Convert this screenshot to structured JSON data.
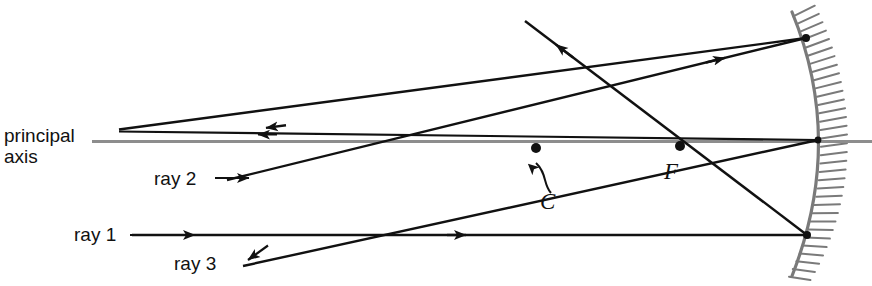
{
  "figure": {
    "labels": {
      "principal_axis": "principal\naxis",
      "ray1": "ray 1",
      "ray2": "ray 2",
      "ray3": "ray 3",
      "center_of_curvature": "C",
      "focal_point": "F"
    },
    "colors": {
      "ray_stroke": "#111111",
      "axis_stroke": "#8d8d8d",
      "mirror_stroke": "#7a7a7a",
      "hatch_stroke": "#7a7a7a",
      "background": "#ffffff",
      "point_fill": "#111111"
    },
    "geometry": {
      "principal_axis": {
        "x1": 92,
        "y1": 141,
        "x2": 872,
        "y2": 141
      },
      "mirror": {
        "vertex": {
          "x": 818,
          "y": 141
        },
        "top": {
          "x": 792,
          "y": 12
        },
        "bottom": {
          "x": 792,
          "y": 276
        },
        "hatch_count": 34
      },
      "points": {
        "C": {
          "x": 536,
          "y": 148
        },
        "F": {
          "x": 680,
          "y": 146
        },
        "upper_mirror_hit": {
          "x": 806,
          "y": 38
        },
        "lower_mirror_hit": {
          "x": 807,
          "y": 235
        }
      },
      "rays": [
        {
          "name": "ray-1-incident",
          "description": "horizontal incoming ray parallel to principal axis",
          "x1": 132,
          "y1": 235,
          "x2": 807,
          "y2": 235,
          "arrow_at": 0.47
        },
        {
          "name": "ray-1-reflected",
          "description": "reflects from lower mirror point through F and up-left",
          "x1": 807,
          "y1": 235,
          "x2": 525,
          "y2": 21,
          "arrow_at": 0.78
        },
        {
          "name": "ray-2-incident",
          "description": "ray through C rising to upper mirror point",
          "x1": 227,
          "y1": 180,
          "x2": 806,
          "y2": 38,
          "arrow_at": 0.77
        },
        {
          "name": "ray-2-reflected",
          "description": "reflected back along itself toward the left, above the axis",
          "x1": 806,
          "y1": 38,
          "x2": 119,
          "y2": 130,
          "arrow_at": 0.52
        },
        {
          "name": "ray-3-incident",
          "description": "ray aimed at the mirror vertex from lower left",
          "x1": 243,
          "y1": 266,
          "x2": 818,
          "y2": 140,
          "arrow_at": 0.06
        },
        {
          "name": "ray-3-reflected",
          "description": "reflects at vertex back to the left along the axis line",
          "x1": 818,
          "y1": 140,
          "x2": 119,
          "y2": 131,
          "arrow_at": 0.55
        }
      ],
      "leaders": [
        {
          "name": "ray-2-leader",
          "x1": 216,
          "y1": 178,
          "x2": 254,
          "y2": 178
        },
        {
          "name": "ray-1-leader",
          "x1": 130,
          "y1": 235,
          "x2": 200,
          "y2": 235
        },
        {
          "name": "ray-3-leader",
          "x1": 243,
          "y1": 266,
          "x2": 270,
          "y2": 258
        },
        {
          "name": "c-leader-curve",
          "path": "M 548 196 C 541 185, 545 172, 535 166"
        }
      ]
    }
  }
}
